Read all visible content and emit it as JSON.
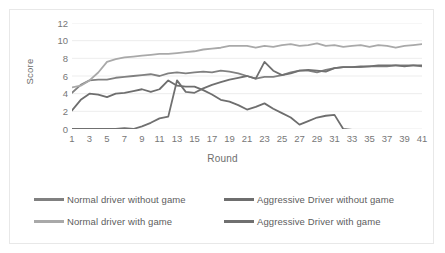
{
  "chart_data": {
    "type": "line",
    "title": "",
    "xlabel": "Round",
    "ylabel": "Score",
    "xlim": [
      1,
      41
    ],
    "ylim": [
      0,
      12
    ],
    "grid": true,
    "legend_position": "bottom",
    "ytick_labels": [
      "12",
      "10",
      "8",
      "6",
      "4",
      "2",
      "0"
    ],
    "ytick_values": [
      12,
      10,
      8,
      6,
      4,
      2,
      0
    ],
    "xtick_labels": [
      "1",
      "3",
      "5",
      "7",
      "9",
      "11",
      "13",
      "15",
      "17",
      "19",
      "21",
      "23",
      "25",
      "27",
      "29",
      "31",
      "33",
      "35",
      "37",
      "39",
      "41"
    ],
    "xtick_values": [
      1,
      3,
      5,
      7,
      9,
      11,
      13,
      15,
      17,
      19,
      21,
      23,
      25,
      27,
      29,
      31,
      33,
      35,
      37,
      39,
      41
    ],
    "x": [
      1,
      2,
      3,
      4,
      5,
      6,
      7,
      8,
      9,
      10,
      11,
      12,
      13,
      14,
      15,
      16,
      17,
      18,
      19,
      20,
      21,
      22,
      23,
      24,
      25,
      26,
      27,
      28,
      29,
      30,
      31,
      32,
      33,
      34,
      35,
      36,
      37,
      38,
      39,
      40,
      41
    ],
    "series": [
      {
        "name": "Normal driver without game",
        "color": "#808080",
        "values": [
          4.1,
          5.0,
          5.5,
          5.6,
          5.6,
          5.8,
          5.9,
          6.0,
          6.1,
          6.2,
          6.0,
          6.3,
          6.4,
          6.3,
          6.4,
          6.5,
          6.4,
          6.6,
          6.5,
          6.3,
          6.0,
          5.7,
          5.9,
          5.9,
          6.1,
          6.4,
          6.6,
          6.6,
          6.4,
          6.7,
          6.9,
          7.0,
          7.0,
          7.0,
          7.1,
          7.1,
          7.1,
          7.2,
          7.2,
          7.2,
          7.1
        ]
      },
      {
        "name": "Normal driver  with game",
        "color": "#a9a9a9",
        "values": [
          4.7,
          4.9,
          5.5,
          6.4,
          7.6,
          7.9,
          8.1,
          8.2,
          8.3,
          8.4,
          8.5,
          8.5,
          8.6,
          8.7,
          8.8,
          9.0,
          9.1,
          9.2,
          9.4,
          9.4,
          9.4,
          9.2,
          9.4,
          9.3,
          9.5,
          9.6,
          9.4,
          9.5,
          9.7,
          9.4,
          9.5,
          9.3,
          9.4,
          9.5,
          9.3,
          9.5,
          9.4,
          9.2,
          9.4,
          9.5,
          9.6
        ]
      },
      {
        "name": "Aggressive Driver without game",
        "color": "#6e6e6e",
        "values": [
          2.1,
          3.3,
          4.0,
          3.9,
          3.6,
          4.0,
          4.1,
          4.3,
          4.5,
          4.2,
          4.5,
          5.5,
          4.9,
          4.8,
          4.8,
          4.4,
          3.9,
          3.3,
          3.1,
          2.7,
          2.2,
          2.5,
          2.9,
          2.3,
          1.8,
          1.3,
          0.5,
          0.9,
          1.3,
          1.5,
          1.6,
          0.0,
          -0.1,
          -0.1,
          -0.1,
          -0.1,
          -0.1,
          -0.1,
          -0.1,
          -0.1,
          -0.1
        ]
      },
      {
        "name": "Aggressive Driver with game",
        "color": "#707070",
        "values": [
          0.0,
          0.0,
          0.0,
          0.0,
          0.0,
          0.0,
          0.1,
          0.0,
          0.3,
          0.7,
          1.2,
          1.4,
          5.5,
          4.2,
          4.1,
          4.6,
          5.0,
          5.3,
          5.6,
          5.8,
          6.0,
          5.7,
          7.6,
          6.6,
          6.1,
          6.3,
          6.6,
          6.7,
          6.6,
          6.5,
          6.9,
          7.0,
          7.0,
          7.1,
          7.1,
          7.2,
          7.2,
          7.2,
          7.1,
          7.2,
          7.2
        ]
      }
    ]
  },
  "axes": {
    "y_title": "Score",
    "x_title": "Round"
  }
}
